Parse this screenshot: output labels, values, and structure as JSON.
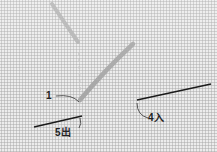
{
  "figure": {
    "labels": {
      "point_1": "1",
      "point_4": "4入",
      "point_5": "5出"
    },
    "colors": {
      "fabric": "#ececec",
      "fabric_weave": "#b9b9b9",
      "thread": "#a8a8a8",
      "needle": "#1a1a1a",
      "leader_line": "#333333"
    }
  }
}
